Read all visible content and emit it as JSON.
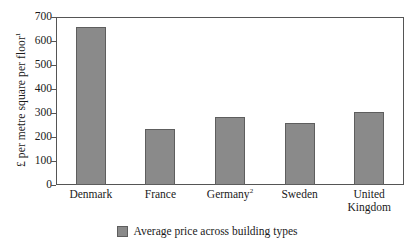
{
  "chart_data": {
    "type": "bar",
    "title": "",
    "subtitle": "",
    "xlabel": "",
    "ylabel": "£ per metre square per floor",
    "ylabel_superscript": "1",
    "categories": [
      "Denmark",
      "France",
      "Germany",
      "Sweden",
      "United Kingdom"
    ],
    "category_superscripts": [
      "",
      "",
      "2",
      "",
      ""
    ],
    "values": [
      660,
      235,
      285,
      260,
      305
    ],
    "ylim": [
      0,
      700
    ],
    "ytick_labels": [
      "0",
      "100",
      "200",
      "300",
      "400",
      "500",
      "600",
      "700"
    ],
    "ytick_values": [
      0,
      100,
      200,
      300,
      400,
      500,
      600,
      700
    ],
    "grid": false,
    "legend_position": "bottom",
    "series": [
      {
        "name": "Average price across building types",
        "values": [
          660,
          235,
          285,
          260,
          305
        ],
        "color": "#8a8a8a"
      }
    ]
  },
  "legend": {
    "label": "Average price across building types",
    "swatch_color": "#8a8a8a"
  },
  "colors": {
    "bar_fill": "#8a8a8a",
    "bar_stroke": "#5e5e5e",
    "axis": "#555555",
    "text": "#1a1a1a",
    "background": "#ffffff"
  }
}
